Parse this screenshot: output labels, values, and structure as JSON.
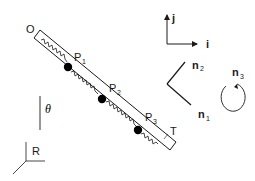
{
  "diagram": {
    "title": "",
    "labels": {
      "origin": "O",
      "end": "T",
      "angle": "θ",
      "reference_frame": "R",
      "particles": [
        {
          "name": "P",
          "sub": "1"
        },
        {
          "name": "P",
          "sub": "2"
        },
        {
          "name": "P",
          "sub": "3"
        }
      ],
      "inertial_axes": {
        "i": "i",
        "j": "j"
      },
      "body_vectors": [
        {
          "name": "n",
          "sub": "1"
        },
        {
          "name": "n",
          "sub": "2"
        },
        {
          "name": "n",
          "sub": "3"
        }
      ]
    },
    "colors": {
      "stroke": "#1a1a1a",
      "particle": "#000000",
      "background": "#ffffff"
    }
  }
}
